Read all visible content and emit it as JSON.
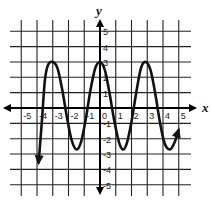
{
  "chart_data": {
    "type": "line",
    "title": "",
    "xlabel": "x",
    "ylabel": "y",
    "xlim": [
      -5,
      5
    ],
    "ylim": [
      -5,
      5
    ],
    "grid": true,
    "x_ticks": [
      "-5",
      "-4",
      "-3",
      "-2",
      "-1",
      "0",
      "1",
      "2",
      "3",
      "4",
      "5"
    ],
    "y_ticks": [
      "5",
      "4",
      "3",
      "2",
      "1",
      "-1",
      "-2",
      "-3",
      "-4",
      "-5"
    ],
    "series": [
      {
        "name": "curve",
        "description": "Periodic (cosine-like) curve with arrowheads at both ends; maxima at y=3, minima near y=-2.7",
        "points": [
          [
            -3.9,
            -3.6
          ],
          [
            -3.7,
            -1.0
          ],
          [
            -3.5,
            1.8
          ],
          [
            -3.3,
            2.8
          ],
          [
            -3.0,
            3.0
          ],
          [
            -2.7,
            2.6
          ],
          [
            -2.4,
            1.2
          ],
          [
            -2.1,
            -0.6
          ],
          [
            -1.8,
            -2.1
          ],
          [
            -1.5,
            -2.7
          ],
          [
            -1.2,
            -2.2
          ],
          [
            -0.9,
            -0.7
          ],
          [
            -0.6,
            1.2
          ],
          [
            -0.3,
            2.6
          ],
          [
            0.0,
            3.0
          ],
          [
            0.3,
            2.5
          ],
          [
            0.6,
            1.0
          ],
          [
            0.9,
            -0.8
          ],
          [
            1.2,
            -2.2
          ],
          [
            1.45,
            -2.7
          ],
          [
            1.7,
            -2.3
          ],
          [
            2.0,
            -0.9
          ],
          [
            2.3,
            1.0
          ],
          [
            2.6,
            2.6
          ],
          [
            2.9,
            3.0
          ],
          [
            3.2,
            2.5
          ],
          [
            3.5,
            1.0
          ],
          [
            3.8,
            -0.9
          ],
          [
            4.1,
            -2.3
          ],
          [
            4.45,
            -2.7
          ],
          [
            4.75,
            -2.2
          ],
          [
            5.0,
            -1.4
          ]
        ],
        "maxima": [
          [
            -3.0,
            3.0
          ],
          [
            0.0,
            3.0
          ],
          [
            2.9,
            3.0
          ]
        ],
        "minima": [
          [
            -1.5,
            -2.7
          ],
          [
            1.45,
            -2.7
          ],
          [
            4.45,
            -2.7
          ]
        ],
        "start_arrow": [
          -3.9,
          -3.6
        ],
        "end_arrow": [
          5.0,
          -1.4
        ]
      }
    ]
  },
  "axes": {
    "x_label": "x",
    "y_label": "y"
  },
  "colors": {
    "grid": "#222222",
    "curve": "#111111",
    "background": "#ffffff"
  }
}
